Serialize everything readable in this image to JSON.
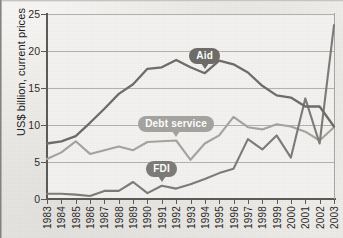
{
  "chart_data": {
    "type": "line",
    "title": "",
    "xlabel": "",
    "ylabel": "US$ billion, current prices",
    "ylim": [
      0,
      25
    ],
    "yticks": [
      0,
      5,
      10,
      15,
      20,
      25
    ],
    "grid": true,
    "legend_position": "inline-labels",
    "x": [
      1983,
      1984,
      1985,
      1986,
      1987,
      1988,
      1989,
      1990,
      1991,
      1992,
      1993,
      1994,
      1995,
      1996,
      1997,
      1998,
      1999,
      2000,
      2001,
      2002,
      2003
    ],
    "categories": [
      "1983",
      "1984",
      "1985",
      "1986",
      "1987",
      "1988",
      "1989",
      "1990",
      "1991",
      "1992",
      "1993",
      "1994",
      "1995",
      "1996",
      "1997",
      "1998",
      "1999",
      "2000",
      "2001",
      "2002",
      "2003"
    ],
    "series": [
      {
        "name": "Aid",
        "color": "#6f6d6a",
        "values": [
          7.5,
          7.8,
          8.5,
          10.3,
          12.2,
          14.2,
          15.5,
          17.6,
          17.8,
          18.8,
          17.8,
          17.0,
          18.7,
          18.2,
          17.1,
          15.3,
          14.0,
          13.7,
          12.5,
          12.5,
          9.8
        ]
      },
      {
        "name": "Debt service",
        "color": "#a6a4a0",
        "values": [
          5.4,
          6.3,
          7.8,
          6.1,
          6.6,
          7.1,
          6.6,
          7.7,
          7.8,
          7.9,
          5.3,
          7.5,
          8.6,
          11.1,
          9.7,
          9.4,
          10.1,
          9.8,
          9.1,
          7.9,
          9.7
        ]
      },
      {
        "name": "FDI",
        "color": "#7e7c78",
        "values": [
          0.7,
          0.7,
          0.6,
          0.4,
          1.1,
          1.1,
          2.3,
          0.8,
          1.8,
          1.4,
          2.0,
          2.7,
          3.5,
          4.1,
          8.1,
          6.7,
          8.6,
          5.6,
          13.6,
          7.5,
          23.5
        ]
      }
    ],
    "annotations": [
      {
        "label": "Aid",
        "series": "Aid",
        "at_x": 1994,
        "style": "badge-dark"
      },
      {
        "label": "Debt service",
        "series": "Debt service",
        "at_x": 1992,
        "style": "badge-light"
      },
      {
        "label": "FDI",
        "series": "FDI",
        "at_x": 1991,
        "style": "badge-medium"
      }
    ],
    "colors": {
      "aid": "#6f6d6a",
      "debt_service": "#a6a4a0",
      "fdi": "#7e7c78",
      "gridline": "#b4b2ae",
      "axis": "#5d5b57",
      "plot_background": "#f3f2f0"
    }
  }
}
